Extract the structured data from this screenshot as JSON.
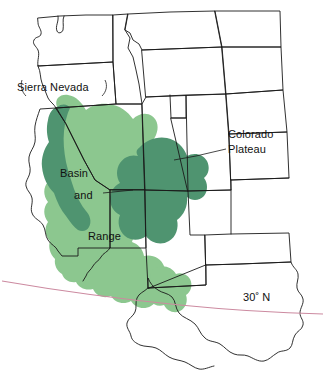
{
  "figure": {
    "background_color": "#ffffff",
    "width": 325,
    "height": 372
  },
  "legend_colors": {
    "province_light_green": "#8cc78f",
    "province_dark_green": "#4f9470",
    "state_boundary": "#1a1a1a",
    "latitude_line": "#cc8aa0",
    "label_text": "#111111"
  },
  "labels": {
    "sierra_nevada": "Sierra Nevada",
    "colorado": "Colorado",
    "plateau": "Plateau",
    "basin": "Basin",
    "and": "and",
    "range": "Range",
    "latitude_30n": "30",
    "latitude_30n_degree": "˚",
    "latitude_30n_suffix": " N"
  },
  "map_features": {
    "regions": [
      {
        "name": "basin-and-range-province",
        "color": "#8cc78f",
        "label": "Basin and Range"
      },
      {
        "name": "sierra-nevada-range",
        "color": "#4f9470",
        "label": "Sierra Nevada"
      },
      {
        "name": "colorado-plateau-province",
        "color": "#4f9470",
        "label": "Colorado Plateau"
      }
    ],
    "latitude_lines": [
      {
        "name": "30-degrees-north",
        "label": "30˚ N",
        "color": "#cc8aa0"
      }
    ],
    "states_outlined": [
      "Washington",
      "Oregon",
      "Idaho",
      "Montana",
      "Wyoming",
      "North Dakota",
      "South Dakota",
      "Nebraska",
      "California",
      "Nevada",
      "Utah",
      "Colorado",
      "Kansas",
      "Arizona",
      "New Mexico",
      "Oklahoma",
      "Texas"
    ]
  }
}
